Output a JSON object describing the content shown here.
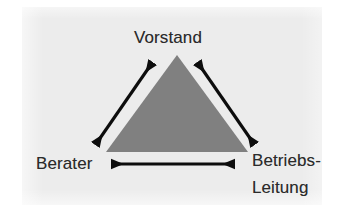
{
  "figure": {
    "type": "triangle-relationship-diagram",
    "caption": "",
    "background_color": "#ececec",
    "page_color": "#ffffff",
    "shape": {
      "name": "triangle",
      "fill_color": "#808080",
      "apex": {
        "x": 177,
        "y": 55
      },
      "bottom_left": {
        "x": 106,
        "y": 152
      },
      "bottom_right": {
        "x": 248,
        "y": 152
      }
    },
    "nodes": [
      {
        "id": "vorstand",
        "label": "Vorstand",
        "position": "top",
        "text_color": "#2b2b2b"
      },
      {
        "id": "berater",
        "label": "Berater",
        "position": "bottom-left",
        "text_color": "#2b2b2b"
      },
      {
        "id": "betriebsleitung",
        "label_line_1": "Betriebs-",
        "label_line_2": "Leitung",
        "label": "Betriebs-Leitung",
        "position": "bottom-right",
        "text_color": "#2b2b2b"
      }
    ],
    "connectors": [
      {
        "id": "berater-vorstand",
        "from": "berater",
        "to": "vorstand",
        "style": "double-headed-arrow",
        "color": "#0d0d0d",
        "x1": 95,
        "y1": 145,
        "x2": 153,
        "y2": 61
      },
      {
        "id": "vorstand-betriebsleitung",
        "from": "vorstand",
        "to": "betriebsleitung",
        "style": "double-headed-arrow",
        "color": "#0d0d0d",
        "x1": 197,
        "y1": 61,
        "x2": 255,
        "y2": 146
      },
      {
        "id": "berater-betriebsleitung",
        "from": "berater",
        "to": "betriebsleitung",
        "style": "double-headed-arrow",
        "color": "#0d0d0d",
        "x1": 108,
        "y1": 164,
        "x2": 238,
        "y2": 164
      }
    ]
  }
}
